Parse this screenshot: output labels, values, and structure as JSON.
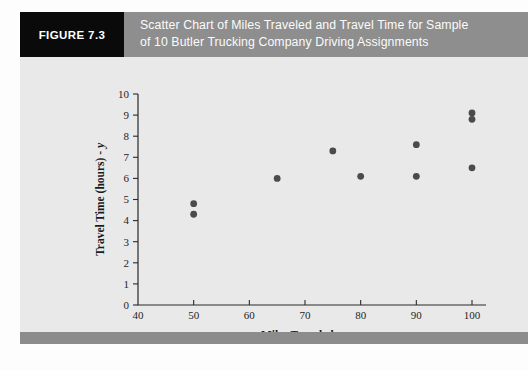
{
  "figure": {
    "tag": "FIGURE 7.3",
    "caption_line_1": "Scatter Chart of Miles Traveled and Travel Time for Sample",
    "caption_line_2": "of 10 Butler Trucking Company Driving Assignments",
    "tag_bg": "#0a0a0a",
    "header_bg": "#8e8e8e",
    "body_bg": "#e9e9e9",
    "footer_bg": "#8c8c8c"
  },
  "chart_data": {
    "type": "scatter",
    "title": "Scatter Chart of Miles Traveled and Travel Time for Sample of 10 Butler Trucking Company Driving Assignments",
    "xlabel": "Miles Traveled - x",
    "xlabel_main": "Miles Traveled - ",
    "xlabel_italic": "x",
    "ylabel": "Travel Time (hours) - y",
    "ylabel_main": "Travel Time (hours) - ",
    "ylabel_italic": "y",
    "xlim": [
      40,
      100
    ],
    "ylim": [
      0,
      10
    ],
    "xticks": [
      40,
      50,
      60,
      70,
      80,
      90,
      100
    ],
    "yticks": [
      0,
      1,
      2,
      3,
      4,
      5,
      6,
      7,
      8,
      9,
      10
    ],
    "xtick_labels": [
      "40",
      "50",
      "60",
      "70",
      "80",
      "90",
      "100"
    ],
    "ytick_labels": [
      "0",
      "1",
      "2",
      "3",
      "4",
      "5",
      "6",
      "7",
      "8",
      "9",
      "10"
    ],
    "grid": false,
    "legend": false,
    "marker_color": "#4b4b4b",
    "marker_size": 3.4,
    "n_points": 10,
    "x": [
      50,
      50,
      65,
      75,
      80,
      90,
      90,
      100,
      100,
      100
    ],
    "y": [
      4.8,
      4.3,
      6.0,
      7.3,
      6.1,
      7.6,
      6.1,
      9.1,
      8.8,
      6.5
    ],
    "points": [
      {
        "x": 50,
        "y": 4.8
      },
      {
        "x": 50,
        "y": 4.3
      },
      {
        "x": 65,
        "y": 6.0
      },
      {
        "x": 75,
        "y": 7.3
      },
      {
        "x": 80,
        "y": 6.1
      },
      {
        "x": 90,
        "y": 7.6
      },
      {
        "x": 90,
        "y": 6.1
      },
      {
        "x": 100,
        "y": 9.1
      },
      {
        "x": 100,
        "y": 8.8
      },
      {
        "x": 100,
        "y": 6.5
      }
    ]
  }
}
